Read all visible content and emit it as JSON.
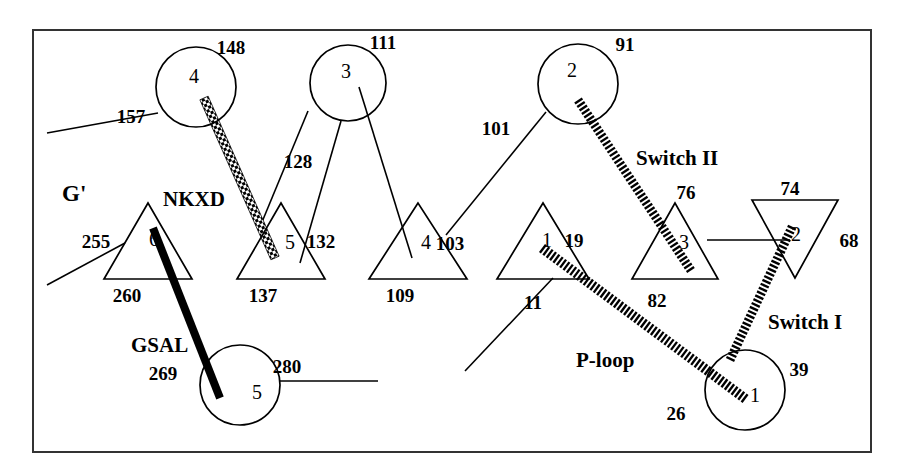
{
  "figure": {
    "frame": {
      "x": 33,
      "y": 30,
      "width": 838,
      "height": 422,
      "stroke": "#333333",
      "stroke_width": 2
    },
    "background": "#ffffff",
    "ink": "#000000"
  },
  "motif_labels": [
    {
      "id": "g-prime",
      "text": "G'",
      "x": 62,
      "y": 193,
      "size": 23
    },
    {
      "id": "nkxd",
      "text": "NKXD",
      "x": 163,
      "y": 199,
      "size": 21
    },
    {
      "id": "gsal",
      "text": "GSAL",
      "x": 131,
      "y": 345,
      "size": 21
    },
    {
      "id": "p-loop",
      "text": "P-loop",
      "x": 576,
      "y": 360,
      "size": 21
    },
    {
      "id": "switch-1",
      "text": "Switch I",
      "x": 768,
      "y": 322,
      "size": 21
    },
    {
      "id": "switch-2",
      "text": "Switch II",
      "x": 636,
      "y": 158,
      "size": 21
    }
  ],
  "helices": [
    {
      "id": "helix-4",
      "label": "4",
      "cx": 196,
      "cy": 87,
      "r": 40,
      "label_dx": -2,
      "label_dy": -11
    },
    {
      "id": "helix-3",
      "label": "3",
      "cx": 348,
      "cy": 83,
      "r": 38,
      "label_dx": -2,
      "label_dy": -12
    },
    {
      "id": "helix-2",
      "label": "2",
      "cx": 578,
      "cy": 84,
      "r": 40,
      "label_dx": -6,
      "label_dy": -14
    },
    {
      "id": "helix-5",
      "label": "5",
      "cx": 240,
      "cy": 385,
      "r": 40,
      "label_dx": 17,
      "label_dy": 7
    },
    {
      "id": "helix-1",
      "label": "1",
      "cx": 745,
      "cy": 390,
      "r": 40,
      "label_dx": 10,
      "label_dy": 5
    }
  ],
  "strands": [
    {
      "id": "strand-6",
      "label": "6",
      "apex_x": 148,
      "apex_y": 203,
      "base_y": 279,
      "half_width": 44,
      "direction": "up",
      "label_dx": 6,
      "label_dy": -40
    },
    {
      "id": "strand-5",
      "label": "5",
      "apex_x": 281,
      "apex_y": 203,
      "base_y": 279,
      "half_width": 44,
      "direction": "up",
      "label_dx": 9,
      "label_dy": -37
    },
    {
      "id": "strand-4",
      "label": "4",
      "apex_x": 418,
      "apex_y": 203,
      "base_y": 279,
      "half_width": 49,
      "direction": "up",
      "label_dx": 8,
      "label_dy": -37
    },
    {
      "id": "strand-1",
      "label": "1",
      "apex_x": 543,
      "apex_y": 203,
      "base_y": 279,
      "half_width": 46,
      "direction": "up",
      "label_dx": 4,
      "label_dy": -39
    },
    {
      "id": "strand-3",
      "label": "3",
      "apex_x": 675,
      "apex_y": 203,
      "base_y": 279,
      "half_width": 43,
      "direction": "up",
      "label_dx": 9,
      "label_dy": -37
    },
    {
      "id": "strand-2",
      "label": "2",
      "apex_x": 795,
      "apex_y": 278,
      "base_y": 200,
      "half_width": 43,
      "direction": "down",
      "label_dx": 1,
      "label_dy": 34
    }
  ],
  "motif_ribbons": [
    {
      "id": "nkxd-ribbon",
      "style": "checker",
      "x1": 204,
      "y1": 98,
      "x2": 275,
      "y2": 258,
      "width": 9
    },
    {
      "id": "switch2-ribbon",
      "style": "hatch",
      "x1": 578,
      "y1": 100,
      "x2": 692,
      "y2": 272,
      "width": 9
    },
    {
      "id": "gsal-ribbon",
      "style": "solid",
      "x1": 153,
      "y1": 228,
      "x2": 220,
      "y2": 398,
      "width": 8
    },
    {
      "id": "ploop-ribbon",
      "style": "hatch",
      "x1": 542,
      "y1": 248,
      "x2": 747,
      "y2": 400,
      "width": 10
    },
    {
      "id": "switch1-ribbon",
      "style": "hatch",
      "x1": 730,
      "y1": 360,
      "x2": 793,
      "y2": 225,
      "width": 9
    }
  ],
  "connectors": [
    {
      "id": "conn-157",
      "x1": 47,
      "y1": 133,
      "x2": 158,
      "y2": 113
    },
    {
      "id": "conn-128",
      "x1": 308,
      "y1": 111,
      "x2": 262,
      "y2": 222
    },
    {
      "id": "conn-132",
      "x1": 341,
      "y1": 121,
      "x2": 300,
      "y2": 263
    },
    {
      "id": "conn-103",
      "x1": 546,
      "y1": 112,
      "x2": 446,
      "y2": 235
    },
    {
      "id": "conn-109",
      "x1": 359,
      "y1": 87,
      "x2": 412,
      "y2": 258
    },
    {
      "id": "conn-255",
      "x1": 47,
      "y1": 285,
      "x2": 125,
      "y2": 243
    },
    {
      "id": "conn-280",
      "x1": 280,
      "y1": 381,
      "x2": 378,
      "y2": 381
    },
    {
      "id": "conn-11",
      "x1": 465,
      "y1": 371,
      "x2": 553,
      "y2": 278
    },
    {
      "id": "conn-76",
      "x1": 707,
      "y1": 240,
      "x2": 790,
      "y2": 240
    }
  ],
  "residue_numbers": [
    {
      "id": "res-148",
      "text": "148",
      "x": 231,
      "y": 47
    },
    {
      "id": "res-157",
      "text": "157",
      "x": 131,
      "y": 116
    },
    {
      "id": "res-111",
      "text": "111",
      "x": 383,
      "y": 42
    },
    {
      "id": "res-128",
      "text": "128",
      "x": 298,
      "y": 161
    },
    {
      "id": "res-132",
      "text": "132",
      "x": 321,
      "y": 241
    },
    {
      "id": "res-91",
      "text": "91",
      "x": 625,
      "y": 44
    },
    {
      "id": "res-101",
      "text": "101",
      "x": 496,
      "y": 128
    },
    {
      "id": "res-103",
      "text": "103",
      "x": 450,
      "y": 243
    },
    {
      "id": "res-109",
      "text": "109",
      "x": 400,
      "y": 295
    },
    {
      "id": "res-137",
      "text": "137",
      "x": 263,
      "y": 295
    },
    {
      "id": "res-260",
      "text": "260",
      "x": 127,
      "y": 295
    },
    {
      "id": "res-255",
      "text": "255",
      "x": 96,
      "y": 241
    },
    {
      "id": "res-269",
      "text": "269",
      "x": 163,
      "y": 373
    },
    {
      "id": "res-280",
      "text": "280",
      "x": 287,
      "y": 366
    },
    {
      "id": "res-19",
      "text": "19",
      "x": 574,
      "y": 240
    },
    {
      "id": "res-11",
      "text": "11",
      "x": 533,
      "y": 302
    },
    {
      "id": "res-26",
      "text": "26",
      "x": 676,
      "y": 413
    },
    {
      "id": "res-39",
      "text": "39",
      "x": 799,
      "y": 369
    },
    {
      "id": "res-76",
      "text": "76",
      "x": 686,
      "y": 192
    },
    {
      "id": "res-82",
      "text": "82",
      "x": 657,
      "y": 300
    },
    {
      "id": "res-74",
      "text": "74",
      "x": 790,
      "y": 188
    },
    {
      "id": "res-68",
      "text": "68",
      "x": 849,
      "y": 240
    }
  ]
}
